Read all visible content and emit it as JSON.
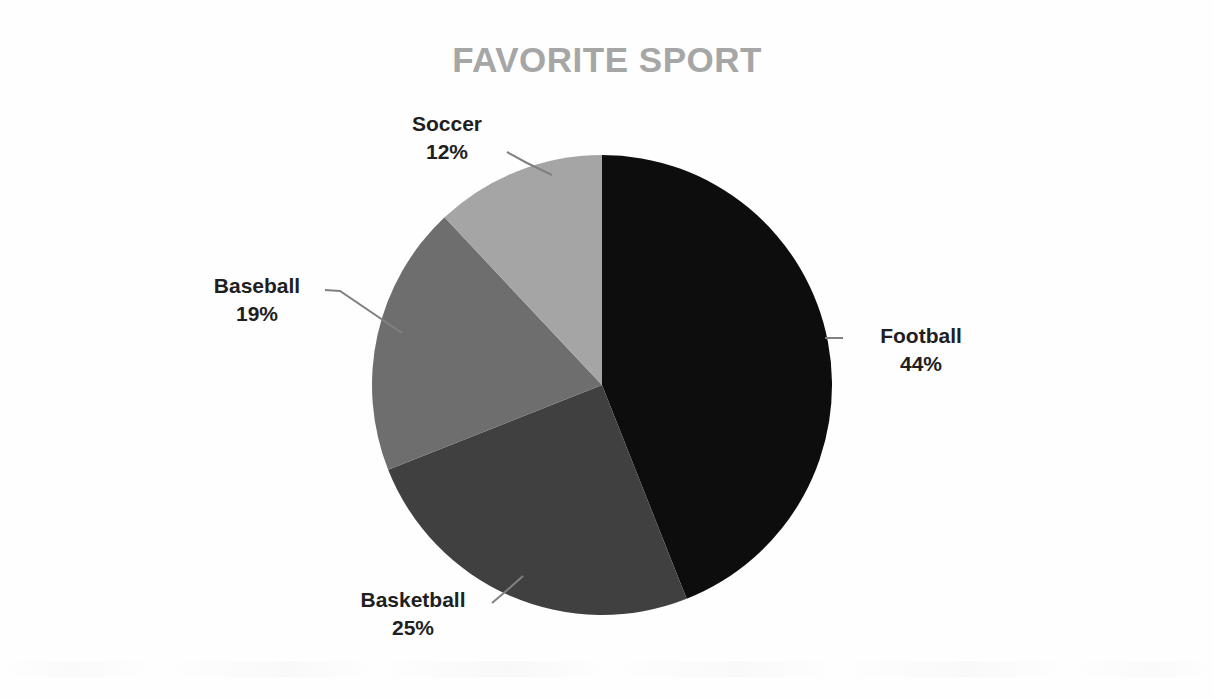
{
  "chart_data": {
    "type": "pie",
    "title": "FAVORITE SPORT",
    "categories": [
      "Football",
      "Basketball",
      "Baseball",
      "Soccer"
    ],
    "values": [
      44,
      25,
      19,
      12
    ],
    "value_unit": "%",
    "labels": [
      {
        "name": "Football",
        "pct": "44%",
        "value": 44,
        "color": "#0d0d0d"
      },
      {
        "name": "Basketball",
        "pct": "25%",
        "value": 25,
        "color": "#404040"
      },
      {
        "name": "Baseball",
        "pct": "19%",
        "value": 19,
        "color": "#6e6e6e"
      },
      {
        "name": "Soccer",
        "pct": "12%",
        "value": 12,
        "color": "#a5a5a5"
      }
    ],
    "start_angle_deg": 0,
    "direction": "clockwise",
    "legend": "none",
    "grid": false,
    "data_labels": "outside-with-leader-lines",
    "title_color": "#a6a6a6",
    "label_color": "#1f1f1f",
    "leader_line_color": "#808080",
    "background_color": "#fefefe"
  },
  "title": {
    "text": "FAVORITE SPORT"
  },
  "slices": {
    "football": {
      "name": "Football",
      "pct": "44%"
    },
    "basketball": {
      "name": "Basketball",
      "pct": "25%"
    },
    "baseball": {
      "name": "Baseball",
      "pct": "19%"
    },
    "soccer": {
      "name": "Soccer",
      "pct": "12%"
    }
  }
}
